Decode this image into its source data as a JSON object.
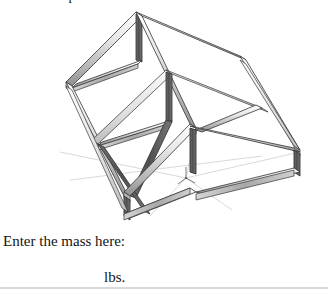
{
  "document": {
    "clipped_heading": "weldment part.",
    "mass_prompt": "Enter the mass here:",
    "mass_units": "lbs."
  },
  "figure": {
    "name": "weldment-frame-isometric",
    "colors": {
      "outline": "#2b2b2b",
      "face_light": "#f2f2f2",
      "face_mid": "#c9c9c9",
      "face_dark": "#6e6e6e",
      "face_shadow": "#4a4a4a",
      "construction_line": "#b9b9b9",
      "background": "#ffffff"
    },
    "origin_marker": {
      "label": "origin-triad",
      "x": 186,
      "y": 174
    }
  }
}
